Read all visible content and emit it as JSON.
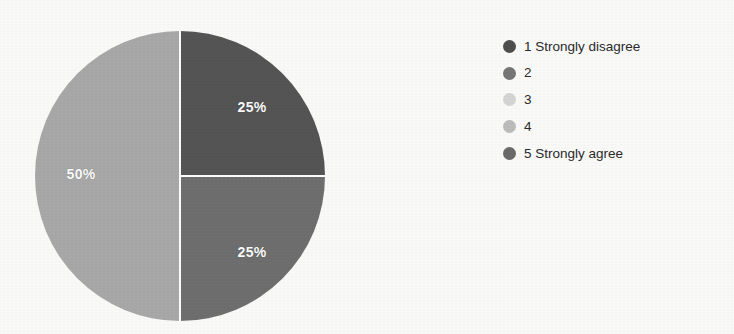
{
  "chart_data": {
    "type": "pie",
    "title": "",
    "subtitle": "",
    "xlabel": "",
    "ylabel": "",
    "grid": false,
    "legend_position": "right",
    "categories": [
      "1 Strongly disagree",
      "2",
      "3",
      "4",
      "5 Strongly agree"
    ],
    "values": [
      25,
      25,
      50,
      0,
      0
    ],
    "unit": "%",
    "slices": [
      {
        "index": 0,
        "category": "1 Strongly disagree",
        "value": 25,
        "label": "25%",
        "color": "#555555",
        "start_angle": 0,
        "end_angle": 90,
        "label_x": 252,
        "label_y": 107
      },
      {
        "index": 1,
        "category": "2",
        "value": 25,
        "label": "25%",
        "color": "#6f6f6f",
        "start_angle": 90,
        "end_angle": 180,
        "label_x": 252,
        "label_y": 252
      },
      {
        "index": 2,
        "category": "3",
        "value": 50,
        "label": "50%",
        "color": "#a9a9a9",
        "start_angle": 180,
        "end_angle": 360,
        "label_x": 81,
        "label_y": 174
      }
    ],
    "geometry": {
      "center_x": 180,
      "center_y": 176,
      "radius": 145,
      "separator_color": "#ffffff",
      "separator_width": 2
    }
  },
  "legend": {
    "items": [
      {
        "label": "1 Strongly disagree",
        "color": "#4f4f4f"
      },
      {
        "label": "2",
        "color": "#777777"
      },
      {
        "label": "3",
        "color": "#d6d6d6"
      },
      {
        "label": "4",
        "color": "#bdbdbd"
      },
      {
        "label": "5 Strongly agree",
        "color": "#6b6b6b"
      }
    ]
  },
  "canvas": {
    "background": "#fbfbfa",
    "width": "734",
    "height": "334"
  }
}
